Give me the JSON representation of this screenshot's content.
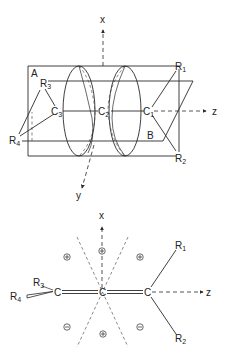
{
  "figure_top": {
    "axis_labels": {
      "x": "x",
      "y": "y",
      "z": "z"
    },
    "plane_labels": {
      "A": "A",
      "B": "B"
    },
    "atoms": {
      "C1": {
        "main": "C",
        "sub": "1"
      },
      "C2": {
        "main": "C",
        "sub": "2"
      },
      "C3": {
        "main": "C",
        "sub": "3"
      }
    },
    "substituents": {
      "R1": {
        "main": "R",
        "sub": "1"
      },
      "R2": {
        "main": "R",
        "sub": "2"
      },
      "R3": {
        "main": "R",
        "sub": "3"
      },
      "R4": {
        "main": "R",
        "sub": "4"
      }
    }
  },
  "figure_bottom": {
    "axis_labels": {
      "x": "x",
      "z": "z"
    },
    "atoms": {
      "left": "C",
      "center": "C",
      "right": "C"
    },
    "substituents": {
      "R1": {
        "main": "R",
        "sub": "1"
      },
      "R2": {
        "main": "R",
        "sub": "2"
      },
      "R3": {
        "main": "R",
        "sub": "3"
      },
      "R4": {
        "main": "R",
        "sub": "4"
      }
    },
    "lobe_signs": [
      {
        "position": "upper-left",
        "sign": "plus"
      },
      {
        "position": "top",
        "sign": "minus"
      },
      {
        "position": "upper-right",
        "sign": "plus"
      },
      {
        "position": "lower-left",
        "sign": "minus"
      },
      {
        "position": "bottom",
        "sign": "plus"
      },
      {
        "position": "lower-right",
        "sign": "minus"
      }
    ]
  },
  "colors": {
    "ink": "#2a2a2a",
    "background": "#ffffff"
  }
}
